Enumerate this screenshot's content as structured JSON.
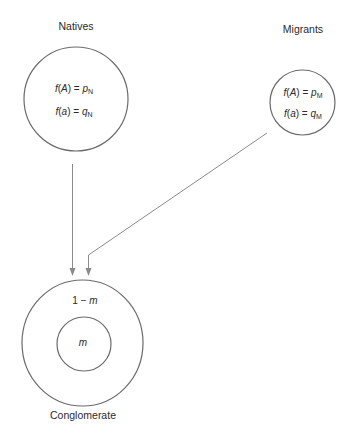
{
  "diagram": {
    "title": "",
    "natives": {
      "label": "Natives",
      "eq1": {
        "func": "f",
        "open": "(",
        "arg": "A",
        "close": ") = ",
        "var": "p",
        "sub": "N"
      },
      "eq2": {
        "func": "f",
        "open": "(",
        "arg": "a",
        "close": ") = ",
        "var": "q",
        "sub": "N"
      }
    },
    "migrants": {
      "label": "Migrants",
      "eq1": {
        "func": "f",
        "open": "(",
        "arg": "A",
        "close": ") = ",
        "var": "p",
        "sub": "M"
      },
      "eq2": {
        "func": "f",
        "open": "(",
        "arg": "a",
        "close": ") = ",
        "var": "q",
        "sub": "M"
      }
    },
    "conglomerate": {
      "label": "Conglomerate",
      "outer": {
        "prefix": "1 − ",
        "var": "m"
      },
      "inner": {
        "var": "m"
      }
    },
    "colors": {
      "stroke": "#6b6b6b",
      "connector": "#8a8a8a",
      "text": "#2a2a2a"
    }
  }
}
